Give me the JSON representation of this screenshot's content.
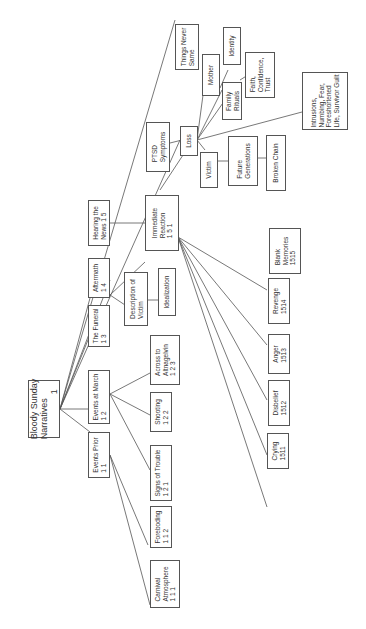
{
  "diagram": {
    "title": "Bloody Sunday Narratives",
    "orientation": "rotated 90 degrees counter-clockwise",
    "nodes": {
      "root": {
        "label": "Bloody Sunday\nNarratives\n                  1"
      },
      "events_prior": {
        "label": "Events Prior\n1 1"
      },
      "carnival": {
        "label": "Carnival\nAtmosphere\n1 1 1"
      },
      "foreboding": {
        "label": "Foreboding\n1 1 2"
      },
      "events_march": {
        "label": "Events at March\n1 2"
      },
      "signs_trouble": {
        "label": "Signs of Trouble\n1 2 1"
      },
      "shooting": {
        "label": "Shooting\n1 2 2"
      },
      "across": {
        "label": "Across to\nAltnagelvin\n1 2 3"
      },
      "funeral": {
        "label": "The Funeral\n1 3"
      },
      "aftermath": {
        "label": "Aftermath\n1 4"
      },
      "description": {
        "label": "Description of\nVictim"
      },
      "idealization": {
        "label": "Idealization"
      },
      "hearing": {
        "label": "Hearing the\nNews 1 5"
      },
      "immediate": {
        "label": "Immediate\nReaction\n1 5 1"
      },
      "crying": {
        "label": "Crying\n1511"
      },
      "disbelief": {
        "label": "Disbelief\n1512"
      },
      "anger": {
        "label": "Anger\n1513"
      },
      "revenge": {
        "label": "Revenge\n1514"
      },
      "blank": {
        "label": "Blank\nMemories\n1515"
      },
      "ptsd": {
        "label": "PTSD\nSymptoms"
      },
      "loss": {
        "label": "Loss"
      },
      "mother": {
        "label": "Mother"
      },
      "identity": {
        "label": "Identity"
      },
      "family_rituals": {
        "label": "Family\nRituals"
      },
      "faith": {
        "label": "Faith,\nConfidence,\nTrust"
      },
      "intrusions": {
        "label": "Intrusions,\nNumbing, Fear,\nForeshortened\nLife, Survivor Guilt"
      },
      "victim": {
        "label": "Victim"
      },
      "future_gen": {
        "label": "Future\nGenerations"
      },
      "broken_chain": {
        "label": "Broken Chain"
      },
      "things_never": {
        "label": "Things Never\nSame"
      }
    }
  }
}
